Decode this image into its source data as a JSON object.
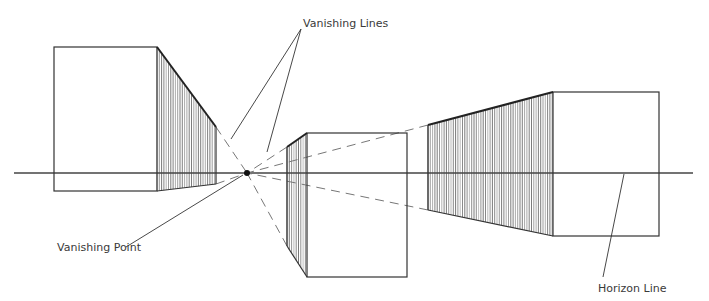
{
  "labels": {
    "vanishing_lines": "Vanishing Lines",
    "vanishing_point": "Vanishing Point",
    "horizon_line": "Horizon Line"
  },
  "colors": {
    "background": "#ffffff",
    "ink": "#333333",
    "hatch": "#555555",
    "guide": "#777777"
  },
  "geometry": {
    "horizon": {
      "x1": 14,
      "x2": 693,
      "y": 173
    },
    "vanishing_point": {
      "x": 247,
      "y": 173
    },
    "boxes": [
      {
        "name": "left-box",
        "front": {
          "x1": 54,
          "y1": 47,
          "x2": 157,
          "y2": 191
        },
        "side_x": 216,
        "side_top": 127,
        "side_bottom": 184,
        "side": "right"
      },
      {
        "name": "center-box",
        "front": {
          "x1": 307,
          "y1": 133,
          "x2": 407,
          "y2": 277
        },
        "side_x": 287,
        "side_top": 147,
        "side_bottom": 246,
        "side": "left"
      },
      {
        "name": "right-box",
        "front": {
          "x1": 553,
          "y1": 92,
          "x2": 659,
          "y2": 236
        },
        "side_x": 428,
        "side_top": 125,
        "side_bottom": 210,
        "side": "left"
      }
    ]
  }
}
